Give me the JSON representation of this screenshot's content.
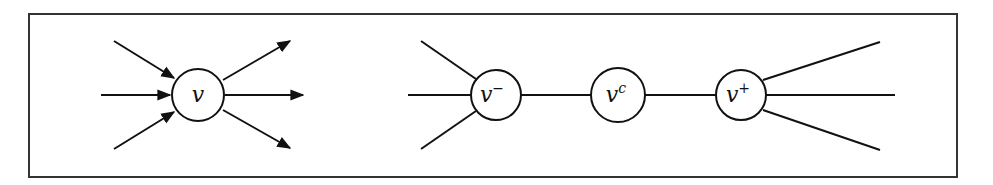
{
  "diagram": {
    "frame": {
      "stroke": "#333333"
    },
    "left": {
      "node": {
        "label": "v",
        "sup": ""
      },
      "incoming_edges": 3,
      "outgoing_edges": 3
    },
    "right": {
      "nodes": [
        {
          "id": "v_minus",
          "label": "v",
          "sup": "−"
        },
        {
          "id": "v_c",
          "label": "v",
          "sup": "c"
        },
        {
          "id": "v_plus",
          "label": "v",
          "sup": "+"
        }
      ],
      "left_edges": 3,
      "right_edges": 3
    }
  }
}
